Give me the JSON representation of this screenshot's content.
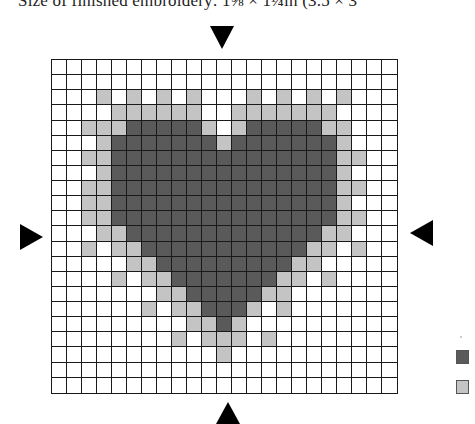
{
  "caption": "Size of finished embroidery: 1⅝ × 1¼in (3.5 × 3",
  "colors": {
    "dark": "#5a5a5a",
    "light": "#c4c4c4",
    "empty": "#ffffff",
    "grid_line": "#1a1a1a"
  },
  "grid": {
    "columns": 23,
    "rows": 22,
    "legend_key": {
      "0": "empty",
      "1": "dark",
      "2": "light"
    },
    "cells": [
      [
        0,
        0,
        0,
        0,
        0,
        0,
        0,
        0,
        0,
        0,
        0,
        0,
        0,
        0,
        0,
        0,
        0,
        0,
        0,
        0,
        0,
        0,
        0
      ],
      [
        0,
        0,
        0,
        0,
        0,
        0,
        0,
        0,
        0,
        0,
        0,
        0,
        0,
        0,
        0,
        0,
        0,
        0,
        0,
        0,
        0,
        0,
        0
      ],
      [
        0,
        0,
        0,
        2,
        0,
        2,
        0,
        2,
        0,
        2,
        0,
        0,
        0,
        2,
        0,
        2,
        0,
        2,
        0,
        2,
        0,
        0,
        0
      ],
      [
        0,
        0,
        0,
        0,
        2,
        2,
        2,
        2,
        2,
        2,
        0,
        0,
        2,
        2,
        2,
        2,
        2,
        2,
        2,
        0,
        0,
        0,
        0
      ],
      [
        0,
        0,
        2,
        2,
        2,
        1,
        1,
        1,
        1,
        1,
        2,
        0,
        2,
        1,
        1,
        1,
        1,
        1,
        2,
        2,
        0,
        0,
        0
      ],
      [
        0,
        0,
        0,
        2,
        1,
        1,
        1,
        1,
        1,
        1,
        1,
        2,
        1,
        1,
        1,
        1,
        1,
        1,
        1,
        2,
        0,
        0,
        0
      ],
      [
        0,
        0,
        2,
        2,
        1,
        1,
        1,
        1,
        1,
        1,
        1,
        1,
        1,
        1,
        1,
        1,
        1,
        1,
        1,
        2,
        2,
        0,
        0
      ],
      [
        0,
        0,
        0,
        2,
        1,
        1,
        1,
        1,
        1,
        1,
        1,
        1,
        1,
        1,
        1,
        1,
        1,
        1,
        1,
        2,
        0,
        0,
        0
      ],
      [
        0,
        0,
        2,
        2,
        1,
        1,
        1,
        1,
        1,
        1,
        1,
        1,
        1,
        1,
        1,
        1,
        1,
        1,
        1,
        2,
        2,
        0,
        0
      ],
      [
        0,
        0,
        2,
        2,
        1,
        1,
        1,
        1,
        1,
        1,
        1,
        1,
        1,
        1,
        1,
        1,
        1,
        1,
        1,
        2,
        0,
        0,
        0
      ],
      [
        0,
        0,
        2,
        2,
        1,
        1,
        1,
        1,
        1,
        1,
        1,
        1,
        1,
        1,
        1,
        1,
        1,
        1,
        1,
        2,
        2,
        0,
        0
      ],
      [
        0,
        0,
        0,
        2,
        2,
        1,
        1,
        1,
        1,
        1,
        1,
        1,
        1,
        1,
        1,
        1,
        1,
        1,
        2,
        2,
        0,
        0,
        0
      ],
      [
        0,
        0,
        2,
        0,
        2,
        2,
        1,
        1,
        1,
        1,
        1,
        1,
        1,
        1,
        1,
        1,
        1,
        2,
        2,
        0,
        2,
        0,
        0
      ],
      [
        0,
        0,
        0,
        0,
        0,
        2,
        2,
        1,
        1,
        1,
        1,
        1,
        1,
        1,
        1,
        1,
        2,
        2,
        0,
        0,
        0,
        0,
        0
      ],
      [
        0,
        0,
        0,
        0,
        2,
        0,
        2,
        2,
        1,
        1,
        1,
        1,
        1,
        1,
        1,
        2,
        2,
        0,
        2,
        0,
        0,
        0,
        0
      ],
      [
        0,
        0,
        0,
        0,
        0,
        0,
        0,
        2,
        2,
        1,
        1,
        1,
        1,
        1,
        2,
        2,
        0,
        0,
        0,
        0,
        0,
        0,
        0
      ],
      [
        0,
        0,
        0,
        0,
        0,
        0,
        2,
        0,
        2,
        2,
        1,
        1,
        1,
        2,
        0,
        2,
        0,
        0,
        0,
        0,
        0,
        0,
        0
      ],
      [
        0,
        0,
        0,
        0,
        0,
        0,
        0,
        0,
        0,
        2,
        2,
        1,
        2,
        0,
        0,
        0,
        0,
        0,
        0,
        0,
        0,
        0,
        0
      ],
      [
        0,
        0,
        0,
        0,
        0,
        0,
        0,
        0,
        2,
        0,
        2,
        2,
        2,
        0,
        2,
        0,
        0,
        0,
        0,
        0,
        0,
        0,
        0
      ],
      [
        0,
        0,
        0,
        0,
        0,
        0,
        0,
        0,
        0,
        0,
        0,
        2,
        0,
        0,
        0,
        0,
        0,
        0,
        0,
        0,
        0,
        0,
        0
      ],
      [
        0,
        0,
        0,
        0,
        0,
        0,
        0,
        0,
        0,
        0,
        0,
        0,
        0,
        0,
        0,
        0,
        0,
        0,
        0,
        0,
        0,
        0,
        0
      ],
      [
        0,
        0,
        0,
        0,
        0,
        0,
        0,
        0,
        0,
        0,
        0,
        0,
        0,
        0,
        0,
        0,
        0,
        0,
        0,
        0,
        0,
        0,
        0
      ]
    ]
  },
  "center_markers": {
    "top": "triangle-down",
    "bottom": "triangle-up",
    "left": "triangle-right",
    "right": "triangle-left"
  },
  "legend": [
    {
      "swatch": "dark"
    },
    {
      "swatch": "light"
    }
  ]
}
